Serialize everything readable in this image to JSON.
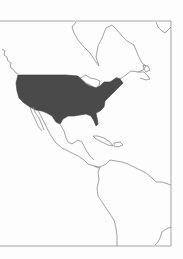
{
  "map": {
    "title": "Map of North and Central America with the United States highlighted",
    "highlighted_region": "United States (contiguous)",
    "visible_regions": [
      "Canada",
      "Greenland (partial)",
      "United States",
      "Mexico",
      "Central America",
      "Caribbean (Cuba, Hispaniola)",
      "South America (northern)"
    ],
    "colors": {
      "background": "#fdfdfd",
      "highlight_fill": "#4a4a4a",
      "outline": "#8a8a8a",
      "frame": "#9a9a9a"
    },
    "style": "grayscale outline map",
    "frame": {
      "left": 0,
      "top": 21,
      "right": 171,
      "bottom": 246
    }
  }
}
